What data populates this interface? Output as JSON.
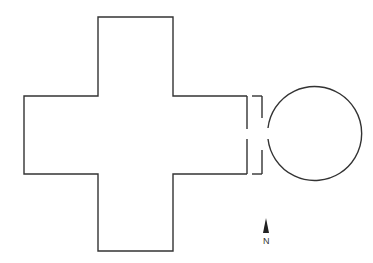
{
  "diagram": {
    "type": "floor-plan",
    "stroke_color": "#333333",
    "background": "#ffffff",
    "cross": {
      "arm_width": 75,
      "center_square": {
        "x1": 98,
        "y1": 96,
        "x2": 173,
        "y2": 174
      },
      "north_arm_top": 17,
      "south_arm_bottom": 251,
      "west_arm_left": 24,
      "east_wall_x": 247
    },
    "vestibule": {
      "inner_wall_x": 247,
      "outer_wall_x": 262,
      "opening": {
        "y1": 129,
        "y2": 139
      }
    },
    "circle_room": {
      "cx": 314,
      "cy": 133,
      "r": 47
    }
  },
  "compass": {
    "label": "N",
    "icon": "north-arrow-icon"
  }
}
